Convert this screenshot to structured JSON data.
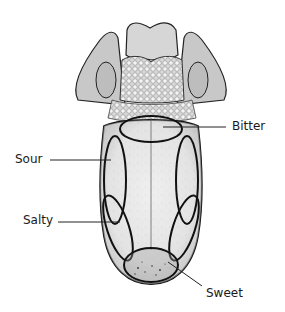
{
  "diagram": {
    "labels": {
      "bitter": "Bitter",
      "sour": "Sour",
      "salty": "Salty",
      "sweet": "Sweet"
    },
    "colors": {
      "outline": "#111111",
      "tongue_fill": "#e6e6e6",
      "shadow": "#9a9a9a",
      "background": "#ffffff"
    }
  }
}
